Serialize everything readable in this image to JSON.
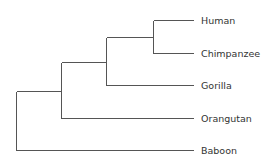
{
  "diagram": {
    "type": "phylogenetic-tree",
    "tree": {
      "name": "root",
      "children": [
        {
          "name": "great-apes",
          "children": [
            {
              "name": "african-apes",
              "children": [
                {
                  "name": "human-chimp",
                  "children": [
                    {
                      "name": "Human"
                    },
                    {
                      "name": "Chimpanzee"
                    }
                  ]
                },
                {
                  "name": "Gorilla"
                }
              ]
            },
            {
              "name": "Orangutan"
            }
          ]
        },
        {
          "name": "Baboon"
        }
      ]
    },
    "leaves": [
      "Human",
      "Chimpanzee",
      "Gorilla",
      "Orangutan",
      "Baboon"
    ],
    "colors": {
      "line": "#555555",
      "text": "#333333"
    }
  }
}
